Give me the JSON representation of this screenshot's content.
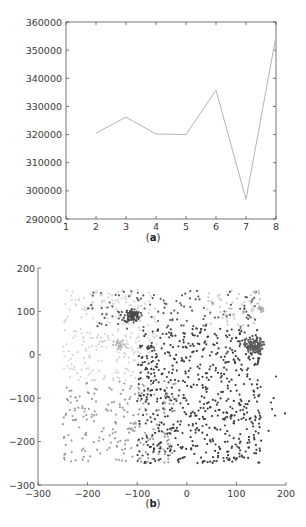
{
  "chart_data": [
    {
      "type": "line",
      "panel": "a",
      "caption": "(a)",
      "caption_letter": "a",
      "title": "",
      "xlabel": "",
      "ylabel": "",
      "x": [
        2,
        3,
        4,
        5,
        6,
        7,
        8
      ],
      "series": [
        {
          "name": "series-1",
          "values": [
            320500,
            326200,
            320200,
            320000,
            335800,
            297000,
            355000
          ],
          "color": "#b5b5b5"
        }
      ],
      "xlim": [
        1,
        8
      ],
      "ylim": [
        290000,
        360000
      ],
      "xticks": [
        1,
        2,
        3,
        4,
        5,
        6,
        7,
        8
      ],
      "yticks": [
        290000,
        300000,
        310000,
        320000,
        330000,
        340000,
        350000,
        360000
      ],
      "grid": false,
      "legend": false
    },
    {
      "type": "scatter",
      "panel": "b",
      "caption": "(b)",
      "caption_letter": "b",
      "title": "",
      "xlabel": "",
      "ylabel": "",
      "xlim": [
        -300,
        200
      ],
      "ylim": [
        -300,
        200
      ],
      "xticks": [
        -300,
        -200,
        -100,
        0,
        100,
        200
      ],
      "yticks": [
        -300,
        -200,
        -100,
        0,
        100,
        200
      ],
      "grid": false,
      "legend": false,
      "clusters": [
        {
          "name": "light-left-region",
          "xrange": [
            -250,
            -60
          ],
          "yrange": [
            -60,
            150
          ],
          "count": 260,
          "color": "#d6d6d6",
          "kind": "uniform"
        },
        {
          "name": "mid-gray-lower-left",
          "xrange": [
            -250,
            -20
          ],
          "yrange": [
            -250,
            -60
          ],
          "count": 230,
          "color": "#9a9a9a",
          "kind": "uniform"
        },
        {
          "name": "dark-upper-band",
          "xrange": [
            -200,
            150
          ],
          "yrange": [
            60,
            150
          ],
          "count": 120,
          "color": "#5a5a5a",
          "kind": "uniform"
        },
        {
          "name": "dark-center",
          "xrange": [
            -100,
            150
          ],
          "yrange": [
            -250,
            60
          ],
          "count": 650,
          "color": "#3c3c3c",
          "kind": "uniform"
        },
        {
          "name": "light-upper-right",
          "xrange": [
            40,
            150
          ],
          "yrange": [
            60,
            150
          ],
          "count": 60,
          "color": "#c8c8c8",
          "kind": "uniform"
        },
        {
          "name": "dense-cluster-upper-left",
          "cx": -110,
          "cy": 90,
          "sd": 8,
          "count": 90,
          "color": "#4a4a4a",
          "kind": "gauss"
        },
        {
          "name": "dense-cluster-right",
          "cx": 135,
          "cy": 20,
          "sd": 9,
          "count": 110,
          "color": "#5c5c5c",
          "kind": "gauss"
        },
        {
          "name": "light-cluster-left",
          "cx": -135,
          "cy": 22,
          "sd": 6,
          "count": 30,
          "color": "#b8b8b8",
          "kind": "gauss"
        },
        {
          "name": "light-cluster-top-right",
          "cx": 150,
          "cy": 105,
          "sd": 4,
          "count": 14,
          "color": "#a8a8a8",
          "kind": "gauss"
        },
        {
          "name": "outliers-right",
          "points": [
            [
              180,
              -50
            ],
            [
              175,
              -100
            ],
            [
              170,
              -110
            ],
            [
              178,
              -140
            ],
            [
              198,
              -135
            ],
            [
              165,
              -175
            ],
            [
              172,
              -125
            ]
          ],
          "color": "#3c3c3c",
          "kind": "points"
        }
      ]
    }
  ]
}
